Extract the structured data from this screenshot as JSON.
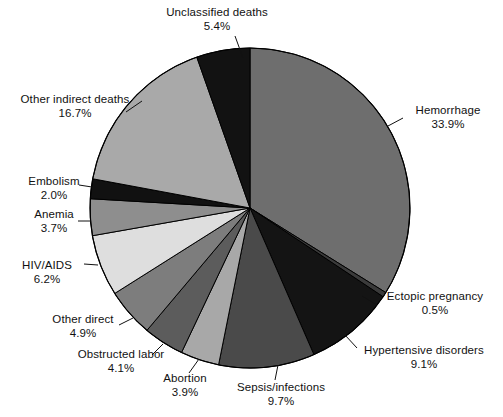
{
  "chart_data": {
    "type": "pie",
    "title": "",
    "subtitle": "",
    "xlabel": "",
    "ylabel": "",
    "legend_position": "none",
    "grid": false,
    "start_angle_deg": 0,
    "direction": "clockwise",
    "units": "percent",
    "categories": [
      "Hemorrhage",
      "Ectopic pregnancy",
      "Hypertensive disorders",
      "Sepsis/infections",
      "Abortion",
      "Obstructed labor",
      "Other direct",
      "HIV/AIDS",
      "Anemia",
      "Embolism",
      "Other indirect deaths",
      "Unclassified deaths"
    ],
    "values": [
      33.9,
      0.5,
      9.1,
      9.7,
      3.9,
      4.1,
      4.9,
      6.2,
      3.7,
      2.0,
      16.7,
      5.4
    ],
    "value_labels": [
      "33.9%",
      "0.5%",
      "9.1%",
      "9.7%",
      "3.9%",
      "4.1%",
      "4.9%",
      "6.2%",
      "3.7%",
      "2.0%",
      "16.7%",
      "5.4%"
    ],
    "slice_colors": [
      "#6e6e6e",
      "#3a3a3a",
      "#141414",
      "#4a4a4a",
      "#a8a8a8",
      "#5c5c5c",
      "#7d7d7d",
      "#dedede",
      "#8e8e8e",
      "#111111",
      "#a9a9a9",
      "#121212"
    ],
    "slices": [
      {
        "label": "Hemorrhage",
        "value": 33.9,
        "value_label": "33.9%",
        "color": "#6e6e6e"
      },
      {
        "label": "Ectopic pregnancy",
        "value": 0.5,
        "value_label": "0.5%",
        "color": "#3a3a3a"
      },
      {
        "label": "Hypertensive disorders",
        "value": 9.1,
        "value_label": "9.1%",
        "color": "#141414"
      },
      {
        "label": "Sepsis/infections",
        "value": 9.7,
        "value_label": "9.7%",
        "color": "#4a4a4a"
      },
      {
        "label": "Abortion",
        "value": 3.9,
        "value_label": "3.9%",
        "color": "#a8a8a8"
      },
      {
        "label": "Obstructed labor",
        "value": 4.1,
        "value_label": "4.1%",
        "color": "#5c5c5c"
      },
      {
        "label": "Other direct",
        "value": 4.9,
        "value_label": "4.9%",
        "color": "#7d7d7d"
      },
      {
        "label": "HIV/AIDS",
        "value": 6.2,
        "value_label": "6.2%",
        "color": "#dedede"
      },
      {
        "label": "Anemia",
        "value": 3.7,
        "value_label": "3.7%",
        "color": "#8e8e8e"
      },
      {
        "label": "Embolism",
        "value": 2.0,
        "value_label": "2.0%",
        "color": "#111111"
      },
      {
        "label": "Other indirect deaths",
        "value": 16.7,
        "value_label": "16.7%",
        "color": "#a9a9a9"
      },
      {
        "label": "Unclassified deaths",
        "value": 5.4,
        "value_label": "5.4%",
        "color": "#121212"
      }
    ],
    "geometry": {
      "center_x": 250,
      "center_y": 208,
      "radius": 160,
      "outline_color": "#000000"
    }
  }
}
